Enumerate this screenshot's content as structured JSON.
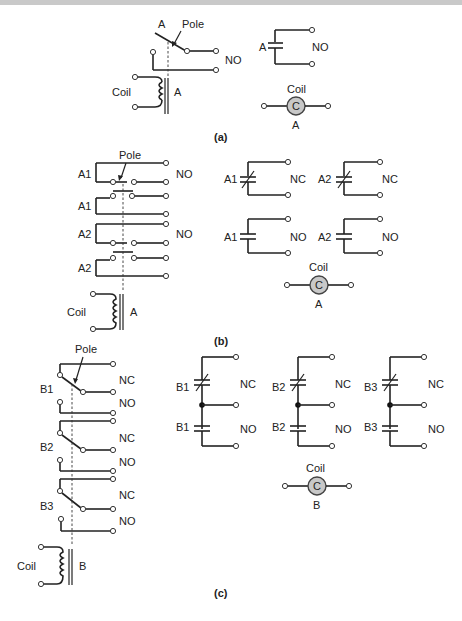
{
  "figure": {
    "panels": [
      {
        "caption": "(a)",
        "relay": {
          "contact_label": "A",
          "pole_label": "Pole",
          "contact_type": "NO",
          "coil_label": "Coil",
          "coil_id": "A"
        },
        "schematic": {
          "contacts": [
            {
              "label": "A",
              "type": "NO"
            }
          ],
          "coil": {
            "top_label": "Coil",
            "symbol": "C",
            "bottom_label": "A"
          }
        }
      },
      {
        "caption": "(b)",
        "relay": {
          "pole_label": "Pole",
          "contacts": [
            {
              "label": "A1",
              "type": "NO"
            },
            {
              "label": "A1",
              "type": ""
            },
            {
              "label": "A2",
              "type": "NO"
            },
            {
              "label": "A2",
              "type": ""
            }
          ],
          "coil_label": "Coil",
          "coil_id": "A"
        },
        "schematic": {
          "contacts": [
            {
              "label": "A1",
              "type": "NC"
            },
            {
              "label": "A2",
              "type": "NC"
            },
            {
              "label": "A1",
              "type": "NO"
            },
            {
              "label": "A2",
              "type": "NO"
            }
          ],
          "coil": {
            "top_label": "Coil",
            "symbol": "C",
            "bottom_label": "A"
          }
        }
      },
      {
        "caption": "(c)",
        "relay": {
          "pole_label": "Pole",
          "poles": [
            {
              "label": "B1",
              "nc": "NC",
              "no": "NO"
            },
            {
              "label": "B2",
              "nc": "NC",
              "no": "NO"
            },
            {
              "label": "B3",
              "nc": "NC",
              "no": "NO"
            }
          ],
          "coil_label": "Coil",
          "coil_id": "B"
        },
        "schematic": {
          "groups": [
            {
              "nc_label": "B1",
              "nc": "NC",
              "no_label": "B1",
              "no": "NO"
            },
            {
              "nc_label": "B2",
              "nc": "NC",
              "no_label": "B2",
              "no": "NO"
            },
            {
              "nc_label": "B3",
              "nc": "NC",
              "no_label": "B3",
              "no": "NO"
            }
          ],
          "coil": {
            "top_label": "Coil",
            "symbol": "C",
            "bottom_label": "B"
          }
        }
      }
    ]
  }
}
